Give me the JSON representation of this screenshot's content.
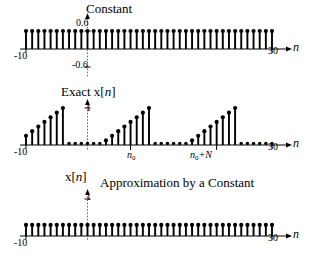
{
  "figure": {
    "axis_variable": "n",
    "x_min_label": "-10",
    "x_max_label": "30",
    "x_min": -10,
    "x_max": 30
  },
  "panels": [
    {
      "id": "constant",
      "title": "Constant",
      "y_tick_top": "0.6",
      "y_tick_bottom": "-0.6",
      "x_left_label": "-10",
      "x_right_label": "30",
      "axis_label": "n"
    },
    {
      "id": "exact",
      "title_prefix": "Exact x[",
      "title_var": "n",
      "title_suffix": "]",
      "y_tick_top": "1",
      "x_left_label": "-10",
      "x_right_label": "30",
      "axis_label": "n",
      "marker_start": "n",
      "marker_start_sub": "0",
      "marker_period_a": "n",
      "marker_period_sub": "0",
      "marker_period_b": "+N"
    },
    {
      "id": "approx",
      "ylabel_prefix": "x[",
      "ylabel_var": "n",
      "ylabel_suffix": "]",
      "title": "Approximation by a Constant",
      "y_tick_top": "1",
      "x_left_label": "-10",
      "x_right_label": "30",
      "axis_label": "n"
    }
  ],
  "chart_data": [
    {
      "type": "line",
      "subtype": "stem",
      "title": "Constant",
      "xlabel": "n",
      "ylabel": "",
      "xlim": [
        -10,
        30
      ],
      "ylim": [
        -0.6,
        0.6
      ],
      "yticks": [
        0.6,
        -0.6
      ],
      "ytick_labels": [
        "0.6",
        "-0.6"
      ],
      "xticks": [
        -10,
        30
      ],
      "xtick_labels": [
        "-10",
        "30"
      ],
      "grid": false,
      "legend": "none",
      "x": [
        -10,
        -9,
        -8,
        -7,
        -6,
        -5,
        -4,
        -3,
        -2,
        -1,
        0,
        1,
        2,
        3,
        4,
        5,
        6,
        7,
        8,
        9,
        10,
        11,
        12,
        13,
        14,
        15,
        16,
        17,
        18,
        19,
        20,
        21,
        22,
        23,
        24,
        25,
        26,
        27,
        28,
        29,
        30
      ],
      "values": [
        0.6,
        0.6,
        0.6,
        0.6,
        0.6,
        0.6,
        0.6,
        0.6,
        0.6,
        0.6,
        0.6,
        0.6,
        0.6,
        0.6,
        0.6,
        0.6,
        0.6,
        0.6,
        0.6,
        0.6,
        0.6,
        0.6,
        0.6,
        0.6,
        0.6,
        0.6,
        0.6,
        0.6,
        0.6,
        0.6,
        0.6,
        0.6,
        0.6,
        0.6,
        0.6,
        0.6,
        0.6,
        0.6,
        0.6,
        0.6,
        0.6
      ]
    },
    {
      "type": "line",
      "subtype": "stem",
      "title": "Exact x[n]",
      "xlabel": "n",
      "ylabel": "",
      "xlim": [
        -10,
        30
      ],
      "ylim": [
        0,
        1
      ],
      "yticks": [
        1
      ],
      "ytick_labels": [
        "1"
      ],
      "xticks": [
        -10,
        30
      ],
      "xtick_labels": [
        "-10",
        "30"
      ],
      "annotations": [
        "n0",
        "n0+N"
      ],
      "grid": false,
      "legend": "none",
      "x": [
        -10,
        -9,
        -8,
        -7,
        -6,
        -5,
        -4,
        -3,
        -2,
        -1,
        0,
        1,
        2,
        3,
        4,
        5,
        6,
        7,
        8,
        9,
        10,
        11,
        12,
        13,
        14,
        15,
        16,
        17,
        18,
        19,
        20,
        21,
        22,
        23,
        24,
        25,
        26,
        27,
        28,
        29,
        30
      ],
      "values": [
        0.25,
        0.375,
        0.5,
        0.625,
        0.75,
        0.875,
        1.0,
        0,
        0,
        0,
        0,
        0,
        0,
        0.125,
        0.25,
        0.375,
        0.5,
        0.625,
        0.75,
        0.875,
        1.0,
        0,
        0,
        0,
        0,
        0,
        0,
        0.125,
        0.25,
        0.375,
        0.5,
        0.625,
        0.75,
        0.875,
        1.0,
        0,
        0,
        0,
        0,
        0,
        0
      ]
    },
    {
      "type": "line",
      "subtype": "stem",
      "title": "Approximation by a Constant",
      "xlabel": "n",
      "ylabel": "x[n]",
      "xlim": [
        -10,
        30
      ],
      "ylim": [
        0,
        1
      ],
      "yticks": [
        1
      ],
      "ytick_labels": [
        "1"
      ],
      "xticks": [
        -10,
        30
      ],
      "xtick_labels": [
        "-10",
        "30"
      ],
      "grid": false,
      "legend": "none",
      "x": [
        -10,
        -9,
        -8,
        -7,
        -6,
        -5,
        -4,
        -3,
        -2,
        -1,
        0,
        1,
        2,
        3,
        4,
        5,
        6,
        7,
        8,
        9,
        10,
        11,
        12,
        13,
        14,
        15,
        16,
        17,
        18,
        19,
        20,
        21,
        22,
        23,
        24,
        25,
        26,
        27,
        28,
        29,
        30
      ],
      "values": [
        0.3,
        0.3,
        0.3,
        0.3,
        0.3,
        0.3,
        0.3,
        0.3,
        0.3,
        0.3,
        0.3,
        0.3,
        0.3,
        0.3,
        0.3,
        0.3,
        0.3,
        0.3,
        0.3,
        0.3,
        0.3,
        0.3,
        0.3,
        0.3,
        0.3,
        0.3,
        0.3,
        0.3,
        0.3,
        0.3,
        0.3,
        0.3,
        0.3,
        0.3,
        0.3,
        0.3,
        0.3,
        0.3,
        0.3,
        0.3,
        0.3
      ]
    }
  ]
}
